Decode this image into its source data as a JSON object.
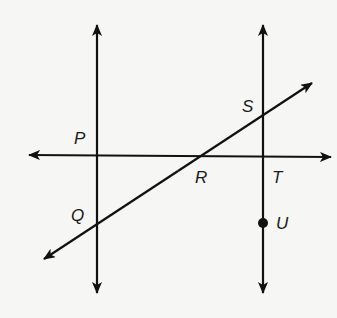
{
  "diagram": {
    "colors": {
      "line": "#111111",
      "background": "#f6f6f4"
    },
    "lines": [
      {
        "id": "left-vertical",
        "type": "line",
        "through": [
          "P",
          "Q"
        ]
      },
      {
        "id": "right-vertical",
        "type": "line",
        "through": [
          "S",
          "T",
          "U"
        ]
      },
      {
        "id": "horizontal",
        "type": "line",
        "through": [
          "P",
          "R",
          "T"
        ]
      },
      {
        "id": "transversal",
        "type": "line",
        "through": [
          "Q",
          "R",
          "S"
        ]
      }
    ],
    "points": [
      {
        "name": "P",
        "label": "P",
        "marked": false
      },
      {
        "name": "Q",
        "label": "Q",
        "marked": false
      },
      {
        "name": "R",
        "label": "R",
        "marked": false
      },
      {
        "name": "S",
        "label": "S",
        "marked": false
      },
      {
        "name": "T",
        "label": "T",
        "marked": false
      },
      {
        "name": "U",
        "label": "U",
        "marked": true
      }
    ]
  }
}
